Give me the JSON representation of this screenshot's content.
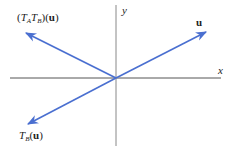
{
  "diagram": {
    "axes": {
      "x_label": "x",
      "y_label": "y",
      "color": "#555555",
      "origin": [
        116,
        78
      ]
    },
    "vectors": [
      {
        "id": "u",
        "label": "u",
        "tip": [
          206,
          32
        ],
        "color": "#4a6fd0"
      },
      {
        "id": "TATB_u",
        "label_parts": [
          "(",
          "T",
          "A",
          "T",
          "B",
          ")(",
          "u",
          ")"
        ],
        "tip": [
          26,
          33
        ],
        "color": "#4a6fd0"
      },
      {
        "id": "TB_u",
        "label_parts": [
          "T",
          "B",
          "(",
          "u",
          ")"
        ],
        "tip": [
          28,
          124
        ],
        "color": "#4a6fd0"
      }
    ]
  },
  "labels": {
    "u": "u",
    "tatb_open": "(",
    "tatb_T1": "T",
    "tatb_A": "A",
    "tatb_T2": "T",
    "tatb_B": "B",
    "tatb_mid": ")(",
    "tatb_u": "u",
    "tatb_close": ")",
    "tb_T": "T",
    "tb_B": "B",
    "tb_open": "(",
    "tb_u": "u",
    "tb_close": ")",
    "x_axis": "x",
    "y_axis": "y"
  }
}
